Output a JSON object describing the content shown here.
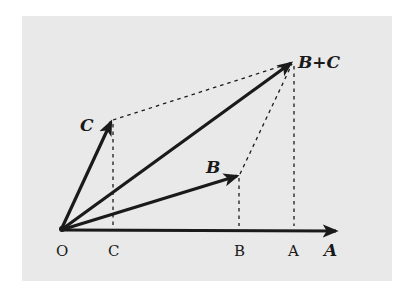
{
  "diagram": {
    "colors": {
      "background": "#e9e9e9",
      "ink": "#1a1a1a"
    },
    "vector_labels": {
      "A": "A",
      "B": "B",
      "C": "C",
      "BC": "B+C"
    },
    "axis_labels": {
      "O": "O",
      "C": "C",
      "B": "B",
      "A": "A"
    },
    "points": {
      "O": [
        61,
        230
      ],
      "A_tip": [
        338,
        231
      ],
      "B_tip": [
        239,
        175
      ],
      "C_tip": [
        112,
        120
      ],
      "BC_tip": [
        293,
        62
      ]
    }
  }
}
